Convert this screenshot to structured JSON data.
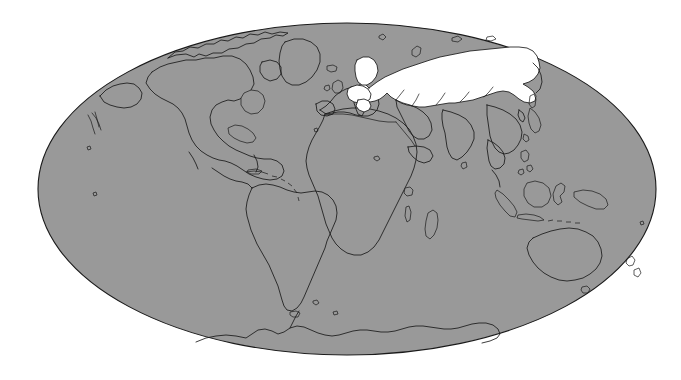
{
  "figure": {
    "type": "world-map",
    "projection": "Mollweide",
    "width": 681,
    "height": 380,
    "background_color": "#ffffff",
    "land_color": "#999999",
    "ocean_color": "#999999",
    "outline_color": "#1a1a1a",
    "highlight_color": "#ffffff",
    "has_graticule": false,
    "has_labels": false,
    "has_legend": false,
    "has_title_text": false
  },
  "globe": {
    "center_x": 347,
    "center_y": 189,
    "radius_x": 309,
    "radius_y": 166
  },
  "highlighted": {
    "name": "Russia",
    "color": "#ffffff",
    "description": "Russian Federation shown in white against gray landmass"
  },
  "continents": [
    {
      "name": "North America"
    },
    {
      "name": "South America"
    },
    {
      "name": "Africa"
    },
    {
      "name": "Europe"
    },
    {
      "name": "Asia"
    },
    {
      "name": "Australia"
    },
    {
      "name": "Antarctica"
    }
  ],
  "notable_features": [
    {
      "name": "Greenland"
    },
    {
      "name": "Madagascar"
    },
    {
      "name": "Japan"
    },
    {
      "name": "Indonesia"
    },
    {
      "name": "British Isles"
    },
    {
      "name": "New Zealand"
    },
    {
      "name": "Caribbean islands"
    },
    {
      "name": "Novaya Zemlya"
    },
    {
      "name": "Kamchatka Peninsula"
    }
  ]
}
